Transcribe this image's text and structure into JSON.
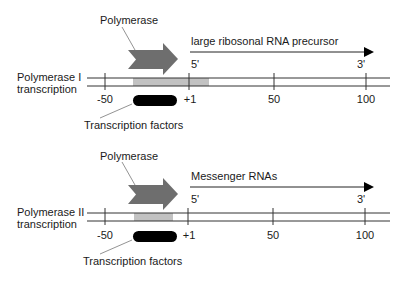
{
  "colors": {
    "line": "#333333",
    "polymerase_arrow": "#6e6e6e",
    "promoter_box": "#c2c2c2",
    "transcription_factor": "#000000",
    "text": "#1a1a1a"
  },
  "panels": [
    {
      "side_label_line1": "Polymerase I",
      "side_label_line2": "transcription",
      "polymerase_label": "Polymerase",
      "transcript_label": "large ribosonal RNA precursor",
      "five_prime": "5'",
      "three_prime": "3'",
      "factor_label": "Transcription factors",
      "ticks": [
        "-50",
        "+1",
        "50",
        "100"
      ]
    },
    {
      "side_label_line1": "Polymerase II",
      "side_label_line2": "transcription",
      "polymerase_label": "Polymerase",
      "transcript_label": "Messenger RNAs",
      "five_prime": "5'",
      "three_prime": "3'",
      "factor_label": "Transcription factors",
      "ticks": [
        "-50",
        "+1",
        "50",
        "100"
      ]
    }
  ]
}
